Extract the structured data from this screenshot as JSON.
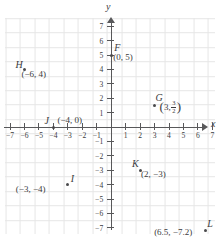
{
  "chart_data": {
    "type": "scatter",
    "title": "",
    "xlabel": "x",
    "ylabel": "y",
    "xlim": [
      -7.6,
      7.6
    ],
    "ylim": [
      -7.6,
      7.6
    ],
    "grid": true,
    "legend": "none",
    "x_ticks": [
      -7,
      -6,
      -5,
      -4,
      -3,
      -2,
      -1,
      1,
      2,
      3,
      4,
      5,
      6,
      7
    ],
    "y_ticks": [
      -7,
      -6,
      -5,
      -4,
      -3,
      -2,
      -1,
      1,
      2,
      3,
      4,
      5,
      6,
      7
    ],
    "x_tick_labels": [
      "-7",
      "-6",
      "-5",
      "-4",
      "-3",
      "-2",
      "-1",
      "1",
      "2",
      "3",
      "4",
      "5",
      "6",
      "7"
    ],
    "y_tick_labels": [
      "-7",
      "-6",
      "-5",
      "-4",
      "-3",
      "-2",
      "-1",
      "1",
      "2",
      "3",
      "4",
      "5",
      "6",
      "7"
    ],
    "points": [
      {
        "name": "F",
        "x": 0,
        "y": 5,
        "coord_label": "(0, 5)",
        "has_fraction": false
      },
      {
        "name": "G",
        "x": 3,
        "y": 1.5,
        "coord_label": "(3, 3/2)",
        "has_fraction": true,
        "frac_lead": "3,",
        "frac_num": "3",
        "frac_den": "2"
      },
      {
        "name": "H",
        "x": -6,
        "y": 4,
        "coord_label": "(-6, 4)",
        "has_fraction": false
      },
      {
        "name": "I",
        "x": -3,
        "y": -4,
        "coord_label": "(-3, -4)",
        "has_fraction": false
      },
      {
        "name": "J",
        "x": -4,
        "y": 0,
        "coord_label": "(-4, 0)",
        "has_fraction": false
      },
      {
        "name": "K",
        "x": 2,
        "y": -3,
        "coord_label": "(2, -3)",
        "has_fraction": false
      },
      {
        "name": "L",
        "x": 6.5,
        "y": -7.2,
        "coord_label": "(6.5, -7.2)",
        "has_fraction": false
      }
    ],
    "colors": {
      "axis": "#58585a",
      "grid": "#e6e6e6",
      "point": "#4a4a4c",
      "text": "#3b3b3d",
      "background": "#ffffff"
    }
  },
  "axes": {
    "x_label": "x",
    "y_label": "y"
  }
}
